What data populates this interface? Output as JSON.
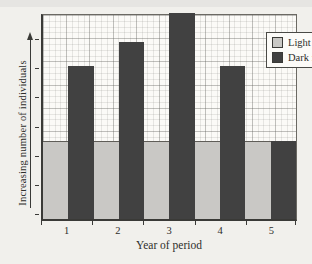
{
  "chart_data": {
    "type": "bar",
    "title": "",
    "xlabel": "Year of period",
    "ylabel": "Increasing number of individuals",
    "categories": [
      "1",
      "2",
      "3",
      "4",
      "5"
    ],
    "series": [
      {
        "name": "Light form",
        "color": "#c9c8c5",
        "values": [
          38,
          38,
          38,
          38,
          38
        ]
      },
      {
        "name": "Dark form",
        "color": "#414141",
        "values": [
          75,
          87,
          101,
          75,
          38
        ]
      }
    ],
    "values_unit": "relative bar height, percent of plot height (y axis has no numeric scale, only an arrow meaning increasing)",
    "ylim": [
      0,
      100
    ],
    "grid": true,
    "grid_style": "fine graph-paper grid with heavier lines every 4 squares",
    "legend_position": "top-right",
    "bar_layout": "paired light/dark bars per year, contiguous, no gaps"
  }
}
